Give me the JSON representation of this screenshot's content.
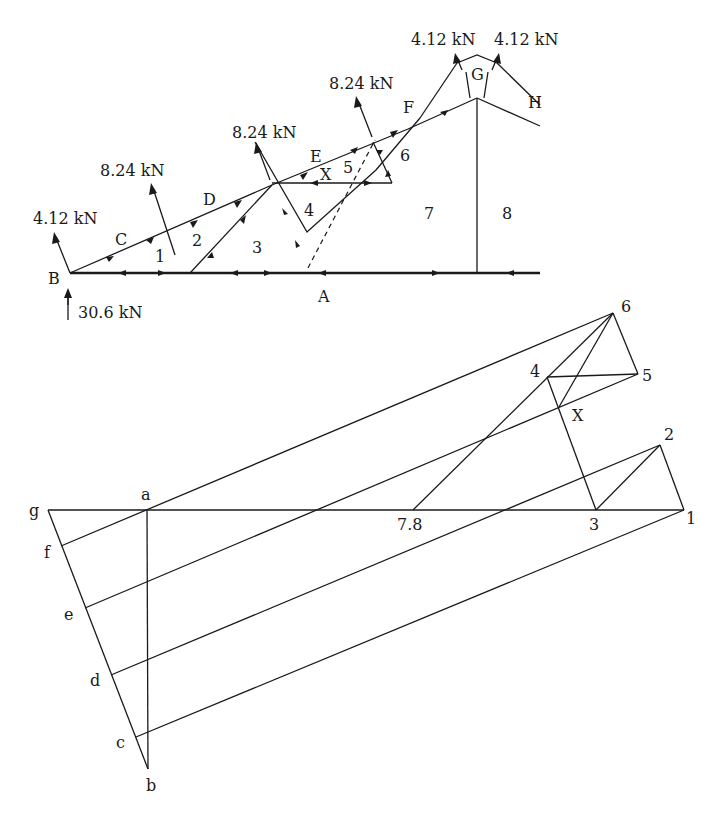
{
  "truss": {
    "loads": {
      "left_end": "4.12 kN",
      "node_c_d": "8.24 kN",
      "node_d_e": "8.24 kN",
      "node_e_f": "8.24 kN",
      "apex_left": "4.12 kN",
      "apex_right": "4.12 kN",
      "reaction": "30.6 kN"
    },
    "space_labels": {
      "A": "A",
      "B": "B",
      "C": "C",
      "D": "D",
      "E": "E",
      "F": "F",
      "G": "G",
      "H": "H",
      "p1": "1",
      "p2": "2",
      "p3": "3",
      "p4": "4",
      "p5": "5",
      "p6": "6",
      "p7": "7",
      "p8": "8",
      "X": "X"
    }
  },
  "force_polygon": {
    "labels": {
      "a": "a",
      "b": "b",
      "c": "c",
      "d": "d",
      "e": "e",
      "f": "f",
      "g": "g",
      "p1": "1",
      "p2": "2",
      "p3": "3",
      "p4": "4",
      "p5": "5",
      "p6": "6",
      "p78": "7.8",
      "X": "X"
    }
  }
}
